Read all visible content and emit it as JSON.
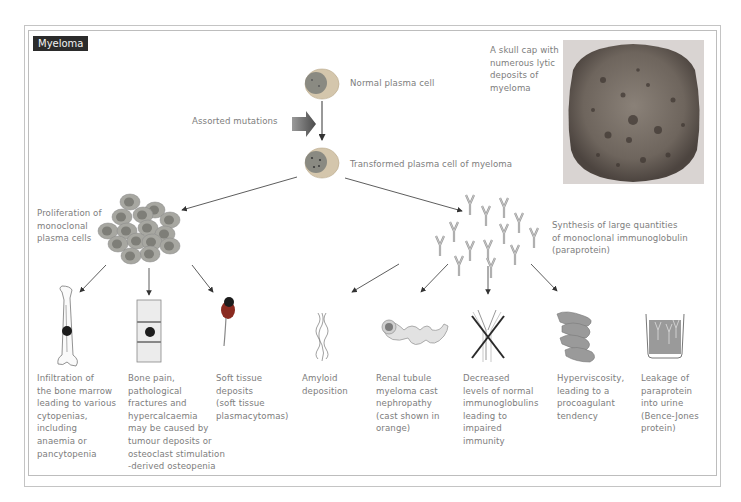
{
  "title": "Myeloma",
  "top": {
    "normal_cell": "Normal plasma cell",
    "mutations": "Assorted mutations",
    "transformed_cell": "Transformed plasma cell of myeloma",
    "skull_caption": "A skull cap with\nnumerous lytic\ndeposits of\nmyeloma"
  },
  "branches": {
    "proliferation": "Proliferation of\nmonoclonal\nplasma cells",
    "synthesis": "Synthesis of large quantities\nof monoclonal immunoglobulin\n(paraprotein)"
  },
  "outcomes": [
    {
      "icon": "bone-marrow-infiltration-icon",
      "text": "Infiltration of\nthe bone marrow\nleading to various\ncytopenias,\nincluding\nanaemia or\npancytopenia"
    },
    {
      "icon": "vertebra-lesion-icon",
      "text": "Bone pain,\npathological\nfractures and\nhypercalcaemia\nmay be caused by\ntumour deposits or\nosteoclast stimulation\n-derived osteopenia"
    },
    {
      "icon": "soft-tissue-deposit-icon",
      "text": "Soft tissue\ndeposits\n(soft tissue\nplasmacytomas)"
    },
    {
      "icon": "amyloid-fibril-icon",
      "text": "Amyloid\ndeposition"
    },
    {
      "icon": "renal-tubule-cast-icon",
      "text": "Renal tubule\nmyeloma cast\nnephropathy\n(cast shown in\norange)"
    },
    {
      "icon": "crossed-antibody-icon",
      "text": "Decreased\nlevels of normal\nimmunoglobulins\nleading to\nimpaired\nimmunity"
    },
    {
      "icon": "hyperviscosity-icon",
      "text": "Hyperviscosity,\nleading to a\nprocoagulant\ntendency"
    },
    {
      "icon": "urine-beaker-icon",
      "text": "Leakage of\nparaprotein\ninto urine\n(Bence-Jones\nprotein)"
    }
  ],
  "colors": {
    "cell_outer": "#c9b89a",
    "cell_nucleus": "#8a8a82",
    "cell_fill": "#a9a9a3",
    "deposit": "#1c1c1c",
    "soft_tissue": "#8a2a20",
    "beaker_fill": "#8a8a8a",
    "text": "#7d7d7d"
  }
}
